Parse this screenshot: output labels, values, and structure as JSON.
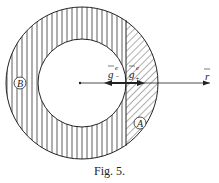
{
  "figure": {
    "caption": "Fig. 5.",
    "labels": {
      "region_a": "A",
      "region_b": "B",
      "g_minus": "g",
      "g_minus_sup": "e",
      "g_minus_sub": "−",
      "g_plus": "g",
      "g_plus_sup": "e",
      "g_plus_sub": "+",
      "r": "r"
    },
    "colors": {
      "line": "#222222",
      "background": "#ffffff"
    }
  }
}
